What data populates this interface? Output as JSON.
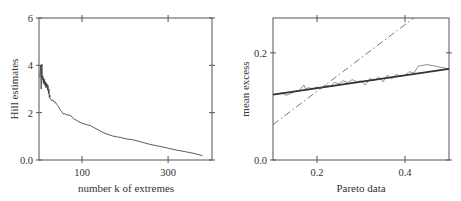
{
  "chart_data": [
    {
      "type": "line",
      "title": "",
      "xlabel": "number k of extremes",
      "ylabel": "Hill estimates",
      "xlim": [
        0,
        402
      ],
      "ylim": [
        0,
        6
      ],
      "xticks": [
        100,
        300
      ],
      "xtick_labels": [
        "100",
        "300"
      ],
      "yticks": [
        0,
        2,
        4,
        6
      ],
      "ytick_labels": [
        "0.0",
        "2",
        "4",
        "6"
      ],
      "grid": false,
      "series": [
        {
          "name": "Hill estimator",
          "x": [
            2,
            4,
            5,
            6,
            7,
            8,
            9,
            10,
            11,
            12,
            13,
            14,
            15,
            16,
            17,
            18,
            19,
            20,
            21,
            22,
            23,
            24,
            25,
            26,
            28,
            30,
            32,
            35,
            38,
            41,
            44,
            47,
            50,
            53,
            56,
            60,
            65,
            70,
            75,
            80,
            90,
            100,
            110,
            120,
            130,
            140,
            150,
            160,
            170,
            180,
            190,
            200,
            220,
            240,
            260,
            280,
            300,
            320,
            340,
            360,
            380,
            390,
            395,
            398,
            400
          ],
          "y": [
            3.5,
            4.0,
            3.0,
            3.9,
            4.05,
            3.4,
            3.55,
            3.25,
            3.45,
            3.2,
            3.4,
            3.15,
            3.3,
            3.05,
            3.25,
            3.1,
            3.2,
            2.95,
            3.15,
            2.8,
            3.0,
            2.65,
            2.75,
            2.6,
            2.55,
            2.5,
            2.55,
            2.45,
            2.45,
            2.35,
            2.3,
            2.2,
            2.1,
            2.05,
            1.95,
            1.95,
            1.9,
            1.9,
            1.85,
            1.75,
            1.65,
            1.55,
            1.5,
            1.45,
            1.35,
            1.25,
            1.15,
            1.08,
            1.02,
            0.98,
            0.95,
            0.9,
            0.85,
            0.75,
            0.65,
            0.58,
            0.5,
            0.42,
            0.35,
            0.28,
            0.18
          ]
        }
      ]
    },
    {
      "type": "line",
      "title": "",
      "xlabel": "Pareto data",
      "ylabel": "mean excess",
      "xlim": [
        0.1,
        0.5
      ],
      "ylim": [
        0.0,
        0.265
      ],
      "xticks": [
        0.2,
        0.4
      ],
      "xtick_labels": [
        "0.2",
        "0.4"
      ],
      "yticks": [
        0.0,
        0.2
      ],
      "ytick_labels": [
        "0.0",
        "0.2"
      ],
      "grid": false,
      "series": [
        {
          "name": "empirical mean excess",
          "style": "thin solid",
          "x": [
            0.1,
            0.12,
            0.13,
            0.14,
            0.15,
            0.16,
            0.17,
            0.175,
            0.18,
            0.19,
            0.2,
            0.21,
            0.22,
            0.23,
            0.24,
            0.25,
            0.26,
            0.27,
            0.28,
            0.29,
            0.3,
            0.31,
            0.32,
            0.33,
            0.34,
            0.35,
            0.36,
            0.37,
            0.38,
            0.39,
            0.4,
            0.41,
            0.42,
            0.43,
            0.45,
            0.47,
            0.5
          ],
          "y": [
            0.122,
            0.125,
            0.121,
            0.124,
            0.128,
            0.13,
            0.14,
            0.132,
            0.135,
            0.133,
            0.136,
            0.134,
            0.14,
            0.137,
            0.145,
            0.142,
            0.148,
            0.144,
            0.15,
            0.146,
            0.148,
            0.14,
            0.152,
            0.148,
            0.155,
            0.146,
            0.158,
            0.152,
            0.16,
            0.156,
            0.158,
            0.165,
            0.162,
            0.175,
            0.178,
            0.175,
            0.17
          ]
        },
        {
          "name": "fitted line (solid)",
          "style": "thick solid",
          "x": [
            0.1,
            0.5
          ],
          "y": [
            0.122,
            0.17
          ]
        },
        {
          "name": "reference line (dash-dot)",
          "style": "dash-dot",
          "x": [
            0.1,
            0.42
          ],
          "y": [
            0.066,
            0.265
          ]
        }
      ]
    }
  ],
  "left_plot": {
    "xlabel": "number k of extremes",
    "ylabel": "Hill estimates",
    "xtick_labels": [
      "100",
      "300"
    ],
    "ytick_labels": [
      "0.0",
      "2",
      "4",
      "6"
    ]
  },
  "right_plot": {
    "xlabel": "Pareto data",
    "ylabel": "mean excess",
    "xtick_labels": [
      "0.2",
      "0.4"
    ],
    "ytick_labels": [
      "0.0",
      "0.2"
    ]
  }
}
